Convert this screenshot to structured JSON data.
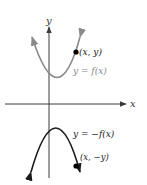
{
  "diagram": {
    "axes": {
      "x_label": "x",
      "y_label": "y"
    },
    "curves": [
      {
        "name": "f",
        "label": "y = f(x)",
        "color": "#8a8a8a",
        "point_label": "(x,  y)",
        "opens": "up"
      },
      {
        "name": "neg-f",
        "label": "y = −f(x)",
        "color": "#1a1a1a",
        "point_label": "(x, −y)",
        "opens": "down"
      }
    ],
    "colors": {
      "axis": "#3a3a3a",
      "point": "#000000",
      "upper_label": "#8a8a8a",
      "lower_label": "#1a1a1a"
    }
  }
}
